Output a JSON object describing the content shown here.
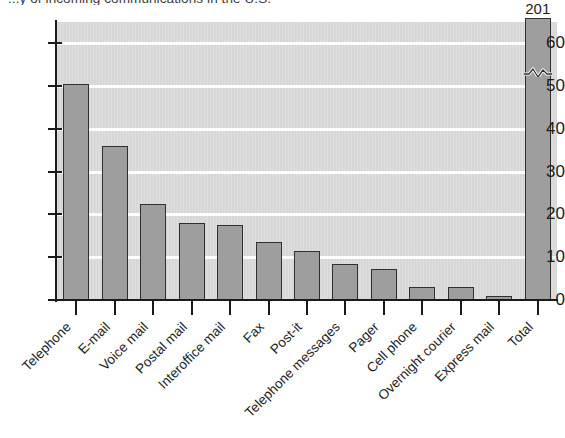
{
  "chart_data": {
    "type": "bar",
    "title": "...y of incoming communications in the U.S.",
    "xlabel": "",
    "ylabel": "",
    "categories": [
      "Telephone",
      "E-mail",
      "Voice mail",
      "Postal mail",
      "Interoffice mail",
      "Fax",
      "Post-it",
      "Telephone messages",
      "Pager",
      "Cell phone",
      "Overnight courier",
      "Express mail",
      "Total"
    ],
    "values": [
      50.5,
      36,
      22.5,
      18,
      17.5,
      13.5,
      11.5,
      8.5,
      7.3,
      3,
      3,
      1,
      201
    ],
    "data_labels": [
      "",
      "",
      "",
      "",
      "",
      "",
      "",
      "",
      "",
      "",
      "",
      "",
      "201"
    ],
    "ylim": [
      0,
      65
    ],
    "yticks": [
      0,
      10,
      20,
      30,
      40,
      50,
      60
    ],
    "ytick_labels": [
      "0",
      "10",
      "20",
      "30",
      "40",
      "50",
      "60"
    ],
    "grid": true,
    "grid_axis": "y",
    "legend": false,
    "axis_break": {
      "series_index": 12,
      "label": "201",
      "note": "Total bar is truncated with a squiggle break mark"
    },
    "colors": {
      "bar_fill": "#9e9e9e",
      "bar_edge": "#303030",
      "plot_background": "#d9d9d9",
      "gridline": "#fdfdfd",
      "axis": "#1a1a1a",
      "text": "#1c1c1c"
    }
  }
}
